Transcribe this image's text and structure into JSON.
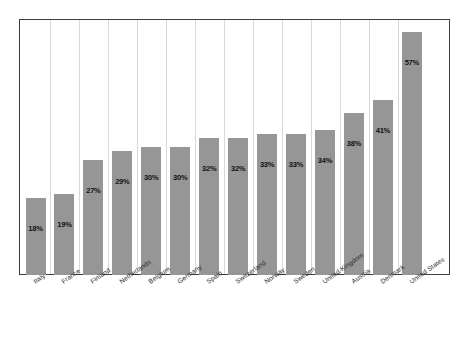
{
  "chart_data": {
    "type": "bar",
    "title": "",
    "subtitle": "",
    "xlabel": "",
    "ylabel": "",
    "ylim": [
      0,
      60
    ],
    "grid": "vertical",
    "legend": "none",
    "orientation": "vertical",
    "bar_color": "#969696",
    "categories": [
      "Italy",
      "France",
      "Finland",
      "Netherlands",
      "Belgium",
      "Germany",
      "Spain",
      "Switzerland",
      "Norway",
      "Sweden",
      "United Kingdom",
      "Austria",
      "Denmark",
      "United States"
    ],
    "values": [
      18,
      19,
      27,
      29,
      30,
      30,
      32,
      32,
      33,
      33,
      34,
      38,
      41,
      57
    ],
    "value_labels": [
      "18%",
      "19%",
      "27%",
      "29%",
      "30%",
      "30%",
      "32%",
      "32%",
      "33%",
      "33%",
      "34%",
      "38%",
      "41%",
      "57%"
    ],
    "axis_tick_labels": [],
    "annotations": []
  }
}
